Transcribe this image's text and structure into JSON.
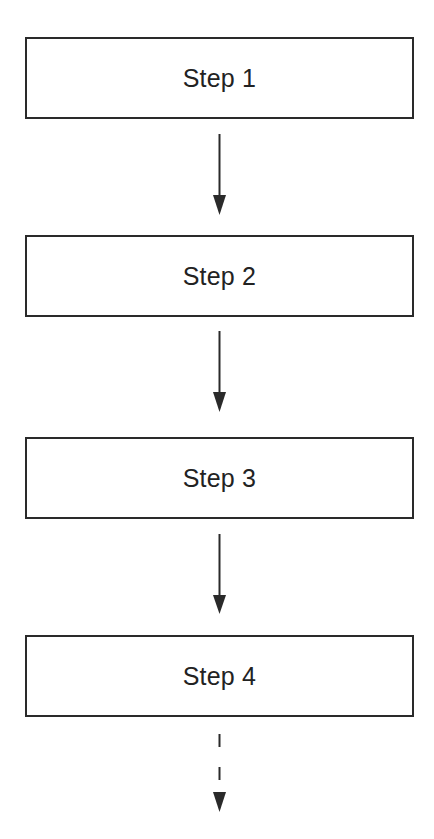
{
  "diagram": {
    "type": "vertical-flowchart",
    "steps": [
      {
        "label": "Step 1"
      },
      {
        "label": "Step 2"
      },
      {
        "label": "Step 3"
      },
      {
        "label": "Step 4"
      }
    ],
    "connectors": [
      {
        "from": "Step 1",
        "to": "Step 2",
        "style": "solid"
      },
      {
        "from": "Step 2",
        "to": "Step 3",
        "style": "solid"
      },
      {
        "from": "Step 3",
        "to": "Step 4",
        "style": "solid"
      },
      {
        "from": "Step 4",
        "to": "",
        "style": "dashed"
      }
    ],
    "colors": {
      "stroke": "#2a2a2a",
      "text": "#222222",
      "background": "#ffffff"
    }
  }
}
